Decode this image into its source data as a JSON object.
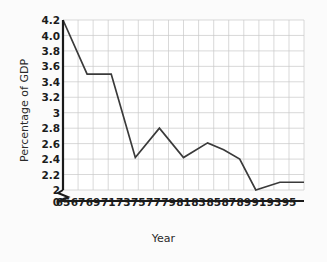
{
  "chart_data": {
    "type": "line",
    "title": "",
    "xlabel": "Year",
    "ylabel": "Percentage of GDP",
    "grid": true,
    "legend": false,
    "axis_break": true,
    "xlim": [
      65,
      95
    ],
    "ylim": [
      2.0,
      4.2
    ],
    "ytick_labels": [
      "4.2",
      "4.0",
      "3.8",
      "3.6",
      "3.4",
      "3.2",
      "3",
      "2.8",
      "2.6",
      "2.4",
      "2.2",
      "2",
      "0"
    ],
    "ytick_values": [
      4.2,
      4.0,
      3.8,
      3.6,
      3.4,
      3.2,
      3.0,
      2.8,
      2.6,
      2.4,
      2.2,
      2.0,
      0
    ],
    "xtick_labels": [
      "65",
      "67",
      "69",
      "71",
      "73",
      "75",
      "77",
      "79",
      "81",
      "83",
      "85",
      "87",
      "89",
      "91",
      "93",
      "95"
    ],
    "xtick_values": [
      65,
      67,
      69,
      71,
      73,
      75,
      77,
      79,
      81,
      83,
      85,
      87,
      89,
      91,
      93,
      95
    ],
    "x": [
      65,
      68,
      71,
      74,
      77,
      80,
      83,
      85,
      87,
      89,
      92,
      95
    ],
    "values": [
      4.2,
      3.5,
      3.5,
      2.42,
      2.8,
      2.42,
      2.61,
      2.52,
      2.4,
      2.0,
      2.1,
      2.1
    ],
    "series": [
      {
        "name": "Percentage of GDP",
        "color": "#3a3a3a",
        "points": [
          {
            "year": 65,
            "value": 4.2
          },
          {
            "year": 68,
            "value": 3.5
          },
          {
            "year": 71,
            "value": 3.5
          },
          {
            "year": 74,
            "value": 2.42
          },
          {
            "year": 77,
            "value": 2.8
          },
          {
            "year": 80,
            "value": 2.42
          },
          {
            "year": 83,
            "value": 2.61
          },
          {
            "year": 85,
            "value": 2.52
          },
          {
            "year": 87,
            "value": 2.4
          },
          {
            "year": 89,
            "value": 2.0
          },
          {
            "year": 92,
            "value": 2.1
          },
          {
            "year": 95,
            "value": 2.1
          }
        ]
      }
    ],
    "colors": {
      "line": "#3a3a3a",
      "grid": "#c9c9c9",
      "axis": "#1a1a1a",
      "background": "#ffffff",
      "page_background": "#fbfbfb",
      "text": "#1c1c1c"
    }
  }
}
